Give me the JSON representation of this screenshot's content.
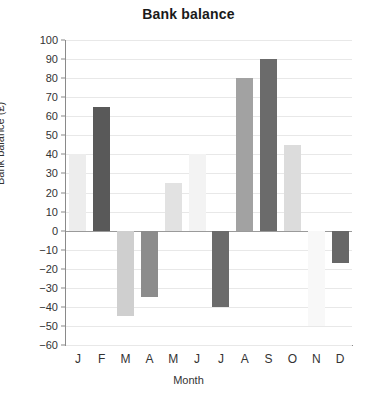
{
  "chart_data": {
    "type": "bar",
    "title": "Bank balance",
    "xlabel": "Month",
    "ylabel": "Bank balance (£)",
    "categories": [
      "J",
      "F",
      "M",
      "A",
      "M",
      "J",
      "J",
      "A",
      "S",
      "O",
      "N",
      "D"
    ],
    "category_full": [
      "January",
      "February",
      "March",
      "April",
      "May",
      "June",
      "July",
      "August",
      "September",
      "October",
      "November",
      "December"
    ],
    "values": [
      40,
      65,
      -45,
      -35,
      25,
      40,
      -40,
      80,
      90,
      45,
      -50,
      -17
    ],
    "bar_colors": [
      "#ededed",
      "#595959",
      "#cfcfcf",
      "#8c8c8c",
      "#e2e2e2",
      "#f3f3f3",
      "#6b6b6b",
      "#a2a2a2",
      "#6b6b6b",
      "#dcdcdc",
      "#f8f8f8",
      "#676767"
    ],
    "ylim": [
      -60,
      100
    ],
    "ytick_values": [
      100,
      90,
      80,
      70,
      60,
      50,
      40,
      30,
      20,
      10,
      0,
      -10,
      -20,
      -30,
      -40,
      -50,
      -60
    ],
    "ytick_labels": [
      "100",
      "90",
      "80",
      "70",
      "60",
      "50",
      "40",
      "30",
      "20",
      "10",
      "0",
      "−10",
      "−20",
      "−30",
      "−40",
      "−50",
      "−60"
    ],
    "grid": true,
    "grid_axis": "y",
    "legend": null,
    "legend_position": "none",
    "zero_line": 0,
    "background_color": "#ffffff",
    "grid_color": "#e8e8e8",
    "axis_color": "#8a8a8a",
    "text_color": "#333333"
  }
}
